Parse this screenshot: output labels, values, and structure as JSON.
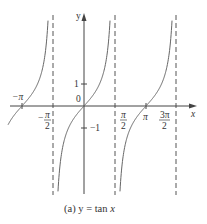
{
  "chart_data": {
    "type": "line",
    "title": "",
    "caption": "(a) y = tan x",
    "caption_prefix": "(a) y = tan ",
    "caption_var": "x",
    "xlabel": "x",
    "ylabel": "y",
    "function": "y = tan x",
    "xlim": [
      -3.5,
      5.3
    ],
    "ylim": [
      -4,
      4.3
    ],
    "grid": false,
    "asymptotes": [
      "-π/2",
      "π/2",
      "3π/2"
    ],
    "x_tick_labels": [
      {
        "label": "−π",
        "value": -3.14159
      },
      {
        "label": "−π/2",
        "value": -1.5708
      },
      {
        "label": "π/2",
        "value": 1.5708
      },
      {
        "label": "π",
        "value": 3.14159
      },
      {
        "label": "3π/2",
        "value": 4.7124
      }
    ],
    "y_tick_labels": [
      {
        "label": "1",
        "value": 1
      },
      {
        "label": "0",
        "value": 0
      },
      {
        "label": "−1",
        "value": -1
      }
    ],
    "series": [
      {
        "name": "tan x, branch (−3π/2, −π/2)",
        "x": [
          -3.45,
          -3.14159,
          -2.8,
          -2.4,
          -2.0,
          -1.75,
          -1.65
        ],
        "y": [
          -0.33,
          0,
          0.36,
          0.92,
          2.19,
          5.5,
          12.6
        ]
      },
      {
        "name": "tan x, branch (−π/2, π/2)",
        "x": [
          -1.5,
          -1.3,
          -1.0,
          -0.5,
          0,
          0.5,
          1.0,
          1.3,
          1.5
        ],
        "y": [
          -14.1,
          -3.6,
          -1.56,
          -0.55,
          0,
          0.55,
          1.56,
          3.6,
          14.1
        ]
      },
      {
        "name": "tan x, branch (π/2, 3π/2)",
        "x": [
          1.64,
          1.84,
          2.14,
          2.64,
          3.14159,
          3.64,
          4.14,
          4.44,
          4.64
        ],
        "y": [
          -14.1,
          -3.6,
          -1.56,
          -0.55,
          0,
          0.55,
          1.56,
          3.6,
          14.1
        ]
      }
    ]
  },
  "labels": {
    "y_axis": "y",
    "x_axis": "x",
    "one": "1",
    "zero": "0",
    "minus_one": "−1",
    "neg_pi": "−π",
    "neg_sign": "−",
    "pi": "π",
    "pi_num": "π",
    "two": "2",
    "three_pi_num": "3π"
  }
}
